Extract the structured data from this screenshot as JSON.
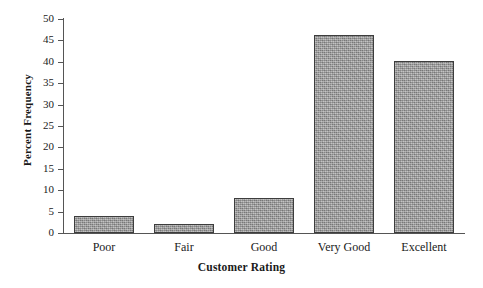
{
  "chart_data": {
    "type": "bar",
    "title": "",
    "xlabel": "Customer Rating",
    "ylabel": "Percent Frequency",
    "categories": [
      "Poor",
      "Fair",
      "Good",
      "Very Good",
      "Excellent"
    ],
    "values": [
      4,
      2,
      8.2,
      46.2,
      40.2
    ],
    "ylim": [
      0,
      50
    ],
    "yticks": [
      0,
      5,
      10,
      15,
      20,
      25,
      30,
      35,
      40,
      45,
      50
    ],
    "ytick_labels": [
      "0",
      "5",
      "10",
      "15",
      "20",
      "25",
      "30",
      "35",
      "40",
      "45",
      "50"
    ],
    "grid": false,
    "legend": false,
    "legend_position": "none",
    "series": [
      {
        "name": "Percent Frequency",
        "values": [
          4,
          2,
          8.2,
          46.2,
          40.2
        ]
      }
    ],
    "bar_fill_color": "#9d9d9d",
    "bar_border_color": "#3d3d3d",
    "axis_color": "#555555",
    "text_color": "#1a1a1a"
  }
}
